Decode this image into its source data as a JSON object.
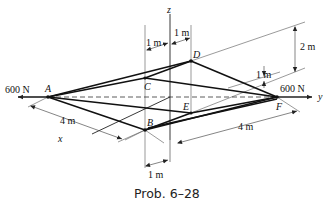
{
  "figure": {
    "caption": "Prob. 6–28",
    "points": {
      "A": "A",
      "B": "B",
      "C": "C",
      "D": "D",
      "E": "E",
      "F": "F"
    },
    "axes": {
      "x": "x",
      "y": "y",
      "z": "z"
    },
    "loads": {
      "left": "600 N",
      "right": "600 N"
    },
    "dimensions": {
      "top_left_1m": "1 m",
      "top_right_1m": "1 m",
      "right_2m": "2 m",
      "right_1m": "1 m",
      "left_4m": "4 m",
      "bottom_right_4m": "4 m",
      "bottom_1m": "1 m"
    }
  }
}
